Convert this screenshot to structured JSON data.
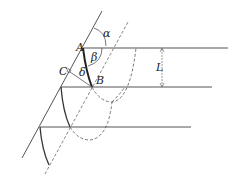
{
  "diagram": {
    "title": "",
    "labels": {
      "A": "A",
      "B": "B",
      "C": "C",
      "alpha": "α",
      "beta": "β",
      "delta": "δ",
      "L": "L"
    },
    "colors": {
      "line": "#555555",
      "thick": "#222222",
      "dashed": "#666666"
    }
  }
}
